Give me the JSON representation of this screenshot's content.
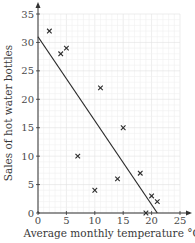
{
  "chart_data": {
    "type": "scatter",
    "title": "",
    "xlabel": "Average monthly temperature °C",
    "ylabel": "Sales of hot water bottles",
    "xlim": [
      0,
      25
    ],
    "ylim": [
      0,
      35
    ],
    "xticks": [
      0,
      5,
      10,
      15,
      20,
      25
    ],
    "yticks": [
      0,
      5,
      10,
      15,
      20,
      25,
      30,
      35
    ],
    "grid": true,
    "legend": null,
    "marker": "x",
    "points": [
      {
        "x": 2,
        "y": 32
      },
      {
        "x": 4,
        "y": 28
      },
      {
        "x": 5,
        "y": 29
      },
      {
        "x": 7,
        "y": 10
      },
      {
        "x": 10,
        "y": 4
      },
      {
        "x": 11,
        "y": 22
      },
      {
        "x": 14,
        "y": 6
      },
      {
        "x": 15,
        "y": 15
      },
      {
        "x": 18,
        "y": 7
      },
      {
        "x": 19,
        "y": 0
      },
      {
        "x": 20,
        "y": 3
      },
      {
        "x": 21,
        "y": 2
      }
    ],
    "line_of_best_fit": {
      "x1": 0,
      "y1": 31,
      "x2": 21,
      "y2": 0
    }
  },
  "colors": {
    "grid_major": "#e0e0e0",
    "grid_minor": "#f0f0f0",
    "axis": "#333333",
    "marker": "#2a2a2a",
    "line": "#2a2a2a"
  }
}
